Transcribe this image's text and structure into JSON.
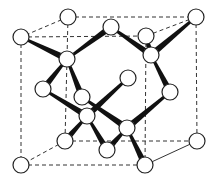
{
  "diagram": {
    "colors": {
      "atom_fill": "#ffffff",
      "atom_stroke": "#222222",
      "bond": "#111111",
      "edge": "#333333"
    },
    "atom_radius": 8,
    "atoms": [
      {
        "id": "A",
        "x": 68,
        "y": 17
      },
      {
        "id": "E",
        "x": 196,
        "y": 17
      },
      {
        "id": "C",
        "x": 111,
        "y": 27
      },
      {
        "id": "B",
        "x": 21,
        "y": 37
      },
      {
        "id": "D",
        "x": 146,
        "y": 36
      },
      {
        "id": "F",
        "x": 67,
        "y": 59
      },
      {
        "id": "G",
        "x": 151,
        "y": 55
      },
      {
        "id": "J",
        "x": 128,
        "y": 78
      },
      {
        "id": "H",
        "x": 43,
        "y": 89
      },
      {
        "id": "K",
        "x": 170,
        "y": 92
      },
      {
        "id": "I",
        "x": 82,
        "y": 97
      },
      {
        "id": "L",
        "x": 87,
        "y": 116
      },
      {
        "id": "M",
        "x": 127,
        "y": 128
      },
      {
        "id": "N",
        "x": 65,
        "y": 141
      },
      {
        "id": "P",
        "x": 197,
        "y": 141
      },
      {
        "id": "O",
        "x": 107,
        "y": 150
      },
      {
        "id": "Q",
        "x": 21,
        "y": 165
      },
      {
        "id": "R",
        "x": 145,
        "y": 165
      }
    ],
    "bonds": [
      [
        "B",
        "F"
      ],
      [
        "F",
        "C"
      ],
      [
        "F",
        "H"
      ],
      [
        "F",
        "I"
      ],
      [
        "C",
        "G"
      ],
      [
        "D",
        "G"
      ],
      [
        "E",
        "G"
      ],
      [
        "G",
        "K"
      ],
      [
        "J",
        "L"
      ],
      [
        "H",
        "L"
      ],
      [
        "L",
        "N"
      ],
      [
        "L",
        "O"
      ],
      [
        "K",
        "M"
      ],
      [
        "I",
        "M"
      ],
      [
        "M",
        "O"
      ],
      [
        "M",
        "R"
      ]
    ],
    "dashed_edges": [
      [
        "A",
        "E"
      ],
      [
        "B",
        "D"
      ],
      [
        "A",
        "B"
      ],
      [
        "E",
        "D"
      ],
      [
        "N",
        "P"
      ],
      [
        "Q",
        "R"
      ],
      [
        "N",
        "Q"
      ],
      [
        "A",
        "N"
      ],
      [
        "E",
        "P"
      ],
      [
        "B",
        "Q"
      ],
      [
        "D",
        "R"
      ]
    ],
    "solid_edges": [
      [
        "P",
        "R"
      ]
    ]
  }
}
